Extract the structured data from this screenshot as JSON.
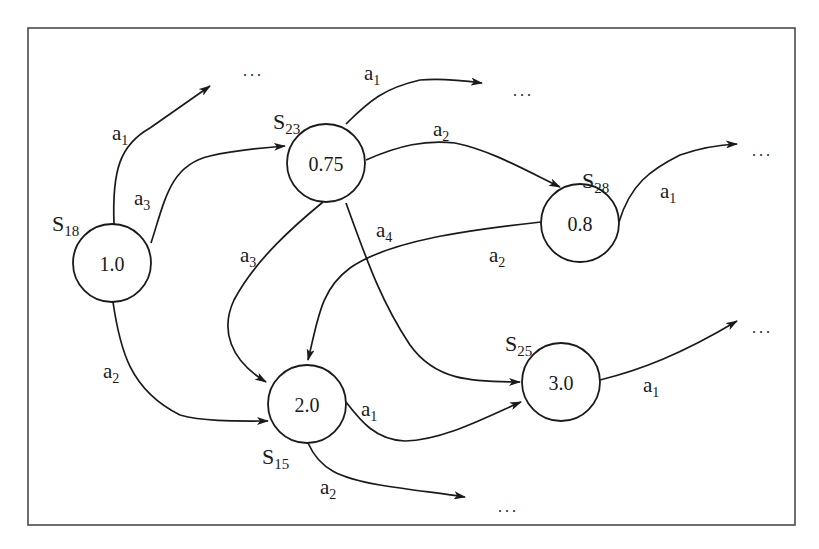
{
  "diagram": {
    "type": "state-transition-graph",
    "frame": {
      "x": 28,
      "y": 28,
      "width": 767,
      "height": 497,
      "stroke": "#4a4a4a"
    },
    "colors": {
      "line": "#1a1a1a",
      "background": "#ffffff"
    },
    "ellipsis": "...",
    "nodes": [
      {
        "id": "S18",
        "label_main": "S",
        "label_sub": "18",
        "value": "1.0",
        "cx": 112,
        "cy": 263,
        "r": 39,
        "label_x": 52,
        "label_y": 223
      },
      {
        "id": "S23",
        "label_main": "S",
        "label_sub": "23",
        "value": "0.75",
        "cx": 326,
        "cy": 163,
        "r": 39,
        "label_x": 273,
        "label_y": 125
      },
      {
        "id": "S28",
        "label_main": "S",
        "label_sub": "28",
        "value": "0.8",
        "cx": 580,
        "cy": 223,
        "r": 39,
        "label_x": 582,
        "label_y": 183
      },
      {
        "id": "S15",
        "label_main": "S",
        "label_sub": "15",
        "value": "2.0",
        "cx": 307,
        "cy": 404,
        "r": 39,
        "label_x": 262,
        "label_y": 460
      },
      {
        "id": "S25",
        "label_main": "S",
        "label_sub": "25",
        "value": "3.0",
        "cx": 561,
        "cy": 382,
        "r": 39,
        "label_x": 505,
        "label_y": 347
      }
    ],
    "edges": [
      {
        "from": "S18",
        "to": "...",
        "action": "a",
        "action_sub": "1",
        "label_x": 112,
        "label_y": 140
      },
      {
        "from": "S18",
        "to": "S23",
        "action": "a",
        "action_sub": "3",
        "label_x": 134,
        "label_y": 205
      },
      {
        "from": "S18",
        "to": "S15",
        "action": "a",
        "action_sub": "2",
        "label_x": 103,
        "label_y": 378
      },
      {
        "from": "S23",
        "to": "...",
        "action": "a",
        "action_sub": "1",
        "label_x": 364,
        "label_y": 80
      },
      {
        "from": "S23",
        "to": "S28",
        "action": "a",
        "action_sub": "2",
        "label_x": 433,
        "label_y": 136
      },
      {
        "from": "S23",
        "to": "S15",
        "action": "a",
        "action_sub": "3",
        "label_x": 240,
        "label_y": 262
      },
      {
        "from": "S23",
        "to": "S25",
        "action": "a",
        "action_sub": "4",
        "label_x": 376,
        "label_y": 237
      },
      {
        "from": "S28",
        "to": "S15",
        "action": "a",
        "action_sub": "2",
        "label_x": 489,
        "label_y": 262
      },
      {
        "from": "S28",
        "to": "...",
        "action": "a",
        "action_sub": "1",
        "label_x": 660,
        "label_y": 198
      },
      {
        "from": "S15",
        "to": "S25",
        "action": "a",
        "action_sub": "1",
        "label_x": 361,
        "label_y": 416
      },
      {
        "from": "S15",
        "to": "...",
        "action": "a",
        "action_sub": "2",
        "label_x": 320,
        "label_y": 494
      },
      {
        "from": "S25",
        "to": "...",
        "action": "a",
        "action_sub": "1",
        "label_x": 643,
        "label_y": 392
      }
    ],
    "ellipsis_positions": [
      {
        "x": 243,
        "y": 76
      },
      {
        "x": 513,
        "y": 96
      },
      {
        "x": 752,
        "y": 156
      },
      {
        "x": 752,
        "y": 333
      },
      {
        "x": 498,
        "y": 512
      }
    ]
  }
}
